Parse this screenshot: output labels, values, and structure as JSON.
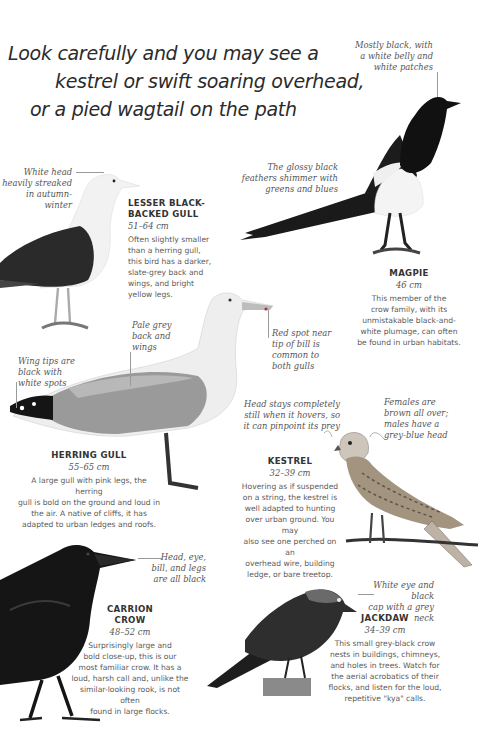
{
  "headline": {
    "line1": "Look carefully and you may see a",
    "line2": "kestrel or swift soaring overhead,",
    "line3": "or a pied wagtail on the path"
  },
  "birds": {
    "lesser_black_backed_gull": {
      "name_line1": "LESSER BLACK-",
      "name_line2": "BACKED GULL",
      "size": "51–64 cm",
      "desc": [
        "Often slightly smaller",
        "than a herring gull,",
        "this bird has a darker,",
        "slate-grey back and",
        "wings, and bright",
        "yellow legs."
      ],
      "note_head": [
        "White head",
        "heavily streaked",
        "in autumn-winter"
      ]
    },
    "magpie": {
      "name": "MAGPIE",
      "size": "46 cm",
      "desc": [
        "This member of the",
        "crow family, with its",
        "unmistakable black-and-",
        "white plumage, can often",
        "be found in urban habitats."
      ],
      "note_body": [
        "Mostly black, with",
        "a white belly and",
        "white patches"
      ],
      "note_tail": [
        "The glossy black",
        "feathers shimmer with",
        "greens and blues"
      ]
    },
    "herring_gull": {
      "name": "HERRING GULL",
      "size": "55–65 cm",
      "desc": [
        "A large gull with pink legs, the herring",
        "gull is bold on the ground and loud in",
        "the air. A native of cliffs, it has",
        "adapted to urban ledges and roofs."
      ],
      "note_back": [
        "Pale grey",
        "back and",
        "wings"
      ],
      "note_wingtips": [
        "Wing tips are",
        "black with",
        "white spots"
      ],
      "note_bill": [
        "Red spot near",
        "tip of bill is",
        "common to",
        "both gulls"
      ]
    },
    "kestrel": {
      "name": "KESTREL",
      "size": "32–39 cm",
      "desc": [
        "Hovering as if suspended",
        "on a string, the kestrel is",
        "well adapted to hunting",
        "over urban ground. You may",
        "also see one perched on an",
        "overhead wire, building",
        "ledge, or bare treetop."
      ],
      "note_head": [
        "Head stays completely",
        "still when it hovers, so",
        "it can pinpoint its prey"
      ],
      "note_female": [
        "Females are",
        "brown all over;",
        "males have a",
        "grey-blue head"
      ]
    },
    "carrion_crow": {
      "name_line1": "CARRION",
      "name_line2": "CROW",
      "size": "48–52 cm",
      "desc": [
        "Surprisingly large and",
        "bold close-up, this is our",
        "most familiar crow. It has a",
        "loud, harsh call and, unlike the",
        "similar-looking rook, is not often",
        "found in large flocks."
      ],
      "note_head": [
        "Head, eye,",
        "bill, and legs",
        "are all black"
      ]
    },
    "jackdaw": {
      "name": "JACKDAW",
      "size": "34–39 cm",
      "desc": [
        "This small grey-black crow",
        "nests in buildings, chimneys,",
        "and holes in trees. Watch for",
        "the aerial acrobatics of their",
        "flocks, and listen for the loud,",
        "repetitive \"kya\" calls."
      ],
      "note_eye": [
        "White eye and black",
        "cap with a grey neck"
      ]
    }
  }
}
